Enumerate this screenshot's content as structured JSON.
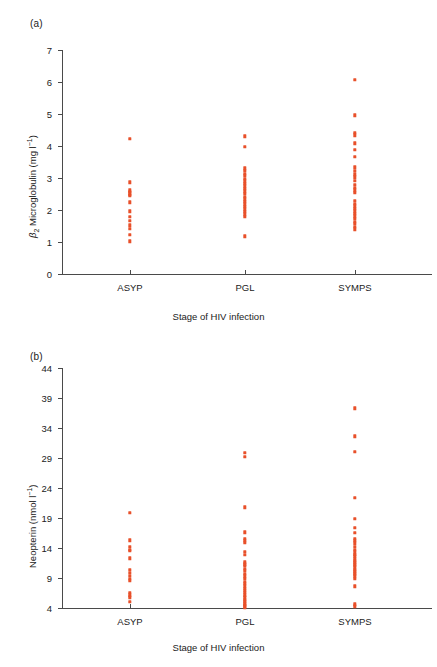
{
  "figure": {
    "panels": [
      {
        "tag": "(a)",
        "xlabel": "Stage of HIV infection",
        "ylabel_html": "β₂ Microglobulin (mg l⁻¹)",
        "ylabel_text": "β₂ Microglobulin (mg l-1)"
      },
      {
        "tag": "(b)",
        "xlabel": "Stage of HIV infection",
        "ylabel_html": "Neopterin (nmol l⁻¹)",
        "ylabel_text": "Neopterin (nmol l-1)"
      }
    ],
    "accent_color": "#e8502a",
    "axis_color": "#4a4a4a"
  },
  "chart_data": [
    {
      "type": "scatter",
      "panel": "(a)",
      "title": "",
      "xlabel": "Stage of HIV infection",
      "ylabel": "β₂ Microglobulin (mg l⁻¹)",
      "categories": [
        "ASYP",
        "PGL",
        "SYMPS"
      ],
      "ylim": [
        0,
        7
      ],
      "yticks": [
        0,
        1,
        2,
        3,
        4,
        5,
        6,
        7
      ],
      "grid": false,
      "legend": "none",
      "series": [
        {
          "name": "ASYP",
          "values": [
            4.22,
            2.86,
            2.62,
            2.56,
            2.52,
            2.48,
            2.44,
            2.24,
            1.96,
            1.78,
            1.66,
            1.52,
            1.42,
            1.22,
            1.02
          ]
        },
        {
          "name": "PGL",
          "values": [
            4.3,
            3.98,
            3.3,
            3.22,
            3.14,
            3.06,
            2.98,
            2.9,
            2.82,
            2.74,
            2.66,
            2.58,
            2.5,
            2.42,
            2.34,
            2.26,
            2.18,
            2.1,
            2.02,
            1.94,
            1.86,
            1.78,
            1.18
          ]
        },
        {
          "name": "SYMPS",
          "values": [
            6.06,
            4.96,
            4.42,
            4.34,
            4.08,
            3.88,
            3.66,
            3.34,
            3.22,
            3.12,
            3.02,
            2.92,
            2.78,
            2.7,
            2.62,
            2.54,
            2.28,
            2.2,
            2.12,
            2.04,
            1.96,
            1.88,
            1.8,
            1.72,
            1.64,
            1.56,
            1.48,
            1.4
          ]
        }
      ]
    },
    {
      "type": "scatter",
      "panel": "(b)",
      "title": "",
      "xlabel": "Stage of HIV infection",
      "ylabel": "Neopterin (nmol l⁻¹)",
      "categories": [
        "ASYP",
        "PGL",
        "SYMPS"
      ],
      "ylim": [
        4,
        44
      ],
      "yticks": [
        4,
        9,
        14,
        19,
        24,
        29,
        34,
        39,
        44
      ],
      "grid": false,
      "legend": "none",
      "series": [
        {
          "name": "ASYP",
          "values": [
            19.9,
            15.3,
            14.2,
            13.7,
            13.5,
            12.3,
            10.4,
            9.9,
            9.4,
            8.9,
            8.5,
            6.5,
            6.1,
            5.8,
            5.0
          ]
        },
        {
          "name": "PGL",
          "values": [
            29.9,
            29.2,
            20.8,
            16.6,
            15.5,
            15.2,
            14.9,
            13.4,
            12.9,
            11.6,
            11.3,
            11.0,
            10.5,
            10.2,
            9.7,
            9.3,
            8.9,
            8.4,
            8.0,
            7.6,
            7.2,
            6.9,
            6.5,
            6.1,
            5.8,
            5.4,
            5.1,
            4.8,
            4.5,
            4.3,
            4.1
          ]
        },
        {
          "name": "SYMPS",
          "values": [
            37.3,
            32.6,
            30.0,
            22.4,
            18.9,
            17.4,
            16.5,
            15.5,
            15.2,
            14.8,
            14.2,
            13.7,
            13.3,
            12.9,
            12.6,
            12.2,
            11.9,
            11.6,
            11.3,
            11.0,
            10.7,
            10.4,
            10.1,
            9.8,
            9.5,
            9.2,
            8.9,
            7.6,
            4.6,
            4.3
          ]
        }
      ]
    }
  ]
}
